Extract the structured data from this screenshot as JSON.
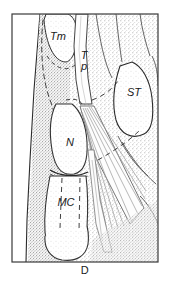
{
  "figure": {
    "panel_label": "D",
    "panel_label_y": 272,
    "frame": {
      "x": 12,
      "y": 14,
      "width": 146,
      "height": 248
    },
    "background_color": "#ffffff",
    "ink_color": "#1a1a1a",
    "stipple_color": "#8d8d8d",
    "tendon_fill": "#fdfdfd",
    "soft_tissue_fill": "#dedede"
  },
  "labels": [
    {
      "id": "tm",
      "text": "Tm",
      "x": 58,
      "y": 40,
      "style": "italic",
      "size": 11
    },
    {
      "id": "tp",
      "text": "T",
      "x": 84,
      "y": 59,
      "style": "italic",
      "size": 11
    },
    {
      "id": "tp2",
      "text": "p",
      "x": 84,
      "y": 70,
      "style": "italic",
      "size": 11
    },
    {
      "id": "st",
      "text": "ST",
      "x": 134,
      "y": 96,
      "style": "italic",
      "size": 11
    },
    {
      "id": "n",
      "text": "N",
      "x": 70,
      "y": 146,
      "style": "italic",
      "size": 11
    },
    {
      "id": "mc",
      "text": "MC",
      "x": 66,
      "y": 206,
      "style": "italic",
      "size": 11
    }
  ],
  "regions": {
    "radius_shaft": "left proximal bone shaft, stippled",
    "trapezium": "Tm — trapezium, outlined oval upper left",
    "trapezoid": "Tp — trapezoid, white vertical band",
    "scaphoid_tubercle": "ST — scaphoid tubercle, right mid",
    "navicular": "N — navicular bone, center",
    "metacarpal": "MC — metacarpal, lower center",
    "ligament_fan": "fan-shaped fibrous ligament radiating to lower right"
  }
}
